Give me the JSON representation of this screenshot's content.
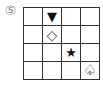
{
  "label": "⑤",
  "grid": {
    "rows": 4,
    "cols": 4,
    "cells": [
      [
        "",
        "▼",
        "",
        ""
      ],
      [
        "",
        "◇",
        "",
        ""
      ],
      [
        "",
        "",
        "★",
        ""
      ],
      [
        "",
        "",
        "",
        "♤"
      ]
    ],
    "symbols": [
      {
        "row": 0,
        "col": 1,
        "glyph": "▼",
        "name": "filled-down-triangle"
      },
      {
        "row": 1,
        "col": 1,
        "glyph": "◇",
        "name": "outline-diamond"
      },
      {
        "row": 2,
        "col": 2,
        "glyph": "★",
        "name": "filled-star"
      },
      {
        "row": 3,
        "col": 3,
        "glyph": "♤",
        "name": "outline-spade"
      }
    ]
  }
}
